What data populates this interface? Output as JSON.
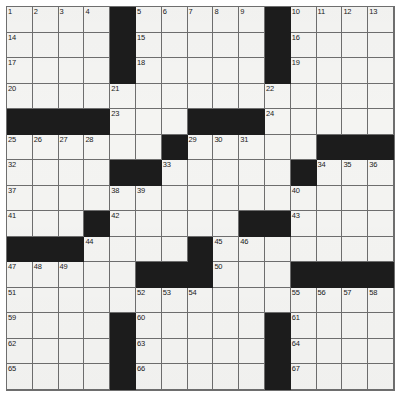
{
  "puzzle": {
    "type": "crossword-grid",
    "rows": 15,
    "columns": 15,
    "colors": {
      "block": "#1c1c1c",
      "cell": "#f4f4f2",
      "gridline": "#6e6e6e",
      "number": "#1a1a1a",
      "page": "#ffffff"
    },
    "grid": [
      [
        "1",
        "2",
        "3",
        "4",
        "#",
        "5",
        "6",
        "7",
        "8",
        "9",
        "#",
        "10",
        "11",
        "12",
        "13"
      ],
      [
        "14",
        "",
        "",
        "",
        "#",
        "15",
        "",
        "",
        "",
        "",
        "#",
        "16",
        "",
        "",
        ""
      ],
      [
        "17",
        "",
        "",
        "",
        "#",
        "18",
        "",
        "",
        "",
        "",
        "#",
        "19",
        "",
        "",
        ""
      ],
      [
        "20",
        "",
        "",
        "",
        "21",
        "",
        "",
        "",
        "",
        "",
        "22",
        "",
        "",
        "",
        ""
      ],
      [
        "#",
        "#",
        "#",
        "#",
        "23",
        "",
        "",
        "#",
        "#",
        "#",
        "24",
        "",
        "",
        "",
        ""
      ],
      [
        "25",
        "26",
        "27",
        "28",
        "",
        "",
        "#",
        "29",
        "30",
        "31",
        "",
        "",
        "#",
        "#",
        "#"
      ],
      [
        "32",
        "",
        "",
        "",
        "#",
        "#",
        "33",
        "",
        "",
        "",
        "",
        "#",
        "34",
        "35",
        "36"
      ],
      [
        "37",
        "",
        "",
        "",
        "38",
        "39",
        "",
        "",
        "",
        "",
        "",
        "40",
        "",
        "",
        ""
      ],
      [
        "41",
        "",
        "",
        "#",
        "42",
        "",
        "",
        "",
        "",
        "#",
        "#",
        "43",
        "",
        "",
        ""
      ],
      [
        "#",
        "#",
        "#",
        "44",
        "",
        "",
        "",
        "#",
        "45",
        "46",
        "",
        "",
        "",
        "",
        ""
      ],
      [
        "47",
        "48",
        "49",
        "",
        "",
        "#",
        "#",
        "#",
        "50",
        "",
        "",
        "#",
        "#",
        "#",
        "#"
      ],
      [
        "51",
        "",
        "",
        "",
        "",
        "52",
        "53",
        "54",
        "",
        "",
        "",
        "55",
        "56",
        "57",
        "58"
      ],
      [
        "59",
        "",
        "",
        "",
        "#",
        "60",
        "",
        "",
        "",
        "",
        "#",
        "61",
        "",
        "",
        ""
      ],
      [
        "62",
        "",
        "",
        "",
        "#",
        "63",
        "",
        "",
        "",
        "",
        "#",
        "64",
        "",
        "",
        ""
      ],
      [
        "65",
        "",
        "",
        "",
        "#",
        "66",
        "",
        "",
        "",
        "",
        "#",
        "67",
        "",
        "",
        ""
      ]
    ],
    "numbers_visible": [
      "1",
      "2",
      "3",
      "4",
      "5",
      "6",
      "7",
      "8",
      "9",
      "10",
      "11",
      "12",
      "13",
      "14",
      "15",
      "16",
      "17",
      "18",
      "19",
      "20",
      "21",
      "22",
      "23",
      "24",
      "25",
      "26",
      "27",
      "28",
      "29",
      "30",
      "31",
      "32",
      "33",
      "34",
      "35",
      "36",
      "37",
      "38",
      "39",
      "40",
      "41",
      "42",
      "43",
      "44",
      "45",
      "46",
      "47",
      "48",
      "49",
      "50",
      "51",
      "52",
      "53",
      "54",
      "55",
      "56",
      "57",
      "58",
      "59",
      "60",
      "61",
      "62",
      "63",
      "64",
      "65",
      "66",
      "67"
    ]
  }
}
